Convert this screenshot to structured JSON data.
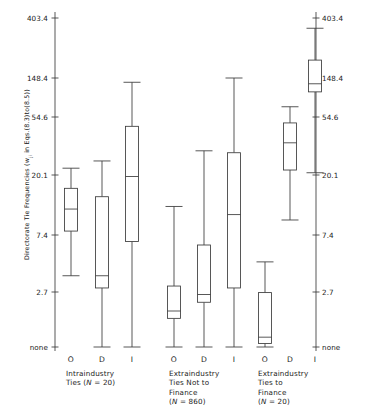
{
  "chart_data": {
    "type": "box",
    "title": "",
    "ylabel": "Directorate Tie Frequencies (w   in Eqs.(8.3)to(8.5))",
    "ylabel_sub": "ji",
    "xlabel": "",
    "y_axis": {
      "scale": "log",
      "tick_labels": [
        "403.4",
        "148.4",
        "54.6",
        "20.1",
        "7.4",
        "2.7",
        "none"
      ],
      "tick_values": [
        403.4,
        148.4,
        54.6,
        20.1,
        7.4,
        2.7,
        0
      ],
      "mirrored_right_axis": true,
      "grid": false
    },
    "categories": [
      "O",
      "D",
      "I"
    ],
    "groups": [
      {
        "name": "Intraindustry Ties",
        "caption_lines": [
          "Intraindustry",
          "Ties ("
        ],
        "caption_n_label": "N",
        "caption_n_value": "= 20)",
        "n": 20,
        "boxes": [
          {
            "category": "O",
            "whisker_low": 3.6,
            "q1": 7.9,
            "median": 11.4,
            "q3": 16.1,
            "whisker_high": 22.6
          },
          {
            "category": "D",
            "whisker_low": 0.0,
            "q1": 2.9,
            "median": 3.6,
            "q3": 14.0,
            "whisker_high": 25.6
          },
          {
            "category": "I",
            "whisker_low": 0.0,
            "q1": 6.6,
            "median": 19.6,
            "q3": 46.5,
            "whisker_high": 133.0
          }
        ]
      },
      {
        "name": "Extraindustry Ties Not to Finance",
        "caption_lines": [
          "Extraindustry",
          "Ties Not to",
          "Finance",
          "("
        ],
        "caption_n_label": "N",
        "caption_n_value": "= 860)",
        "n": 860,
        "boxes": [
          {
            "category": "O",
            "whisker_low": 0.0,
            "q1": 0.5,
            "median": 0.8,
            "q3": 3.0,
            "whisker_high": 11.9
          },
          {
            "category": "D",
            "whisker_low": 0.0,
            "q1": 1.4,
            "median": 2.3,
            "q3": 6.2,
            "whisker_high": 30.5
          },
          {
            "category": "I",
            "whisker_low": 0.0,
            "q1": 2.9,
            "median": 10.4,
            "q3": 29.5,
            "whisker_high": 148.4
          }
        ]
      },
      {
        "name": "Extraindustry Ties to Finance",
        "caption_lines": [
          "Extraindustry",
          "Ties to",
          "Finance",
          "("
        ],
        "caption_n_label": "N",
        "caption_n_value": "= 20)",
        "n": 20,
        "boxes": [
          {
            "category": "O",
            "whisker_low": 0.0,
            "q1": 0.1,
            "median": 0.15,
            "q3": 2.6,
            "whisker_high": 4.6
          },
          {
            "category": "D",
            "whisker_low": 9.5,
            "q1": 21.9,
            "median": 35.0,
            "q3": 49.3,
            "whisker_high": 71.0
          },
          {
            "category": "I",
            "whisker_low": 20.9,
            "q1": 104.0,
            "median": 128.0,
            "q3": 200.0,
            "whisker_high": 340.0
          }
        ]
      }
    ]
  },
  "axis": {
    "none_label": "none"
  }
}
